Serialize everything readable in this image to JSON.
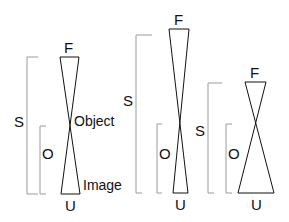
{
  "figure": {
    "type": "optical-diagram",
    "colors": {
      "stroke": "#111111",
      "bracket": "#9a9a9a",
      "background": "#ffffff"
    },
    "panels": [
      {
        "id": "left",
        "top_label": "F",
        "bottom_label": "U",
        "side_label_outer": "S",
        "side_label_inner": "O",
        "annotations": {
          "crossing": "Object",
          "bottom": "Image"
        }
      },
      {
        "id": "middle",
        "top_label": "F",
        "bottom_label": "U",
        "side_label_outer": "S",
        "side_label_inner": "O"
      },
      {
        "id": "right",
        "top_label": "F",
        "bottom_label": "U",
        "side_label_outer": "S",
        "side_label_inner": "O"
      }
    ]
  }
}
